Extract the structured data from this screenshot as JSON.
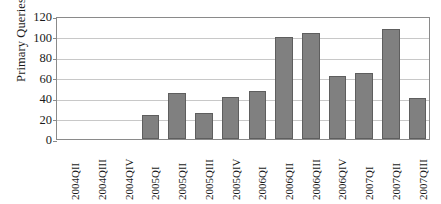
{
  "chart_data": {
    "type": "bar",
    "title": "",
    "subtitle": "",
    "xlabel": "",
    "ylabel": "Primary Queries",
    "ylim": [
      0,
      120
    ],
    "yticks": [
      0,
      20,
      40,
      60,
      80,
      100,
      120
    ],
    "ytick_labels": [
      "0",
      "20",
      "40",
      "60",
      "80",
      "100",
      "120"
    ],
    "grid": true,
    "legend": false,
    "legend_position": "none",
    "bar_color": "#808080",
    "bar_edge_color": "#5e5e5e",
    "gridline_color": "#c8c8c8",
    "axis_color": "#8a8a8a",
    "categories": [
      "2004QII",
      "2004QIII",
      "2004QIV",
      "2005QI",
      "2005QII",
      "2005QIII",
      "2005QIV",
      "2006QI",
      "2006QII",
      "2006QIII",
      "2006QIV",
      "2007QI",
      "2007QII",
      "2007QIII"
    ],
    "values": [
      0,
      0,
      0,
      23,
      45,
      25,
      41,
      47,
      100,
      103,
      61,
      64,
      107,
      40
    ]
  }
}
